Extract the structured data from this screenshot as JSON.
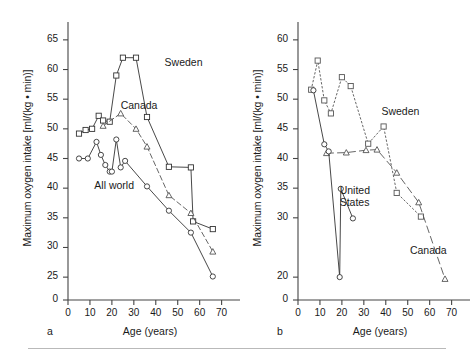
{
  "figure": {
    "bottom_rule": true,
    "axis_color": "#444444",
    "ink_color": "#333333"
  },
  "panels": [
    {
      "tag": "a",
      "xlabel": "Age (years)",
      "ylabel": "Maximum oxygen intake [ml/(kg • min)]"
    },
    {
      "tag": "b",
      "xlabel": "Age (years)",
      "ylabel": "Maximum oxygen intake [ml/(kg • min)]"
    }
  ],
  "chart_data": [
    {
      "type": "line",
      "panel": "a",
      "title": "",
      "xlabel": "Age (years)",
      "ylabel": "Maximum oxygen intake [ml/(kg • min)]",
      "xlim": [
        0,
        72
      ],
      "ylim_break": true,
      "y_axis_origin_label": "0",
      "ylim": [
        23,
        67
      ],
      "xticks": [
        0,
        10,
        20,
        30,
        40,
        50,
        60,
        70
      ],
      "yticks": [
        25,
        30,
        35,
        40,
        45,
        50,
        55,
        60,
        65
      ],
      "grid": false,
      "legend": "inline-annotations",
      "series": [
        {
          "name": "Sweden",
          "marker": "square",
          "linestyle": "solid",
          "color": "#333333",
          "label_x": 44,
          "label_y": 61,
          "points": [
            [
              5,
              49.2
            ],
            [
              8,
              49.8
            ],
            [
              11,
              50.0
            ],
            [
              14,
              52.2
            ],
            [
              16,
              51.4
            ],
            [
              19,
              51.2
            ],
            [
              22,
              59.0
            ],
            [
              25,
              62.0
            ],
            [
              31,
              62.0
            ],
            [
              36,
              52.0
            ],
            [
              46,
              43.6
            ],
            [
              56,
              43.5
            ],
            [
              57,
              34.4
            ],
            [
              66,
              33.1
            ]
          ]
        },
        {
          "name": "Canada",
          "marker": "triangle",
          "linestyle": "dashed",
          "color": "#555555",
          "label_x": 24,
          "label_y": 53.6,
          "points": [
            [
              16,
              50.5
            ],
            [
              24,
              52.6
            ],
            [
              31,
              50.0
            ],
            [
              36,
              47.0
            ],
            [
              46,
              38.8
            ],
            [
              56,
              35.8
            ],
            [
              66,
              29.3
            ]
          ]
        },
        {
          "name": "All world",
          "marker": "circle",
          "linestyle": "solid",
          "color": "#333333",
          "label_x": 12,
          "label_y": 40.2,
          "points": [
            [
              5,
              45.0
            ],
            [
              9,
              45.0
            ],
            [
              13,
              47.8
            ],
            [
              15,
              45.6
            ],
            [
              17,
              43.9
            ],
            [
              19,
              42.8
            ],
            [
              20,
              42.8
            ],
            [
              22,
              48.2
            ],
            [
              24,
              43.5
            ],
            [
              26,
              44.6
            ],
            [
              36,
              40.3
            ],
            [
              46,
              36.2
            ],
            [
              56,
              32.5
            ],
            [
              66,
              25.1
            ]
          ]
        }
      ]
    },
    {
      "type": "line",
      "panel": "b",
      "title": "",
      "xlabel": "Age (years)",
      "ylabel": "Maximum oxygen intake [ml/(kg • min)]",
      "xlim": [
        0,
        72
      ],
      "ylim_break": true,
      "y_axis_origin_label": "0",
      "ylim": [
        18,
        62
      ],
      "xticks": [
        0,
        10,
        20,
        30,
        40,
        50,
        60,
        70
      ],
      "yticks": [
        20,
        30,
        35,
        40,
        45,
        50,
        55,
        60
      ],
      "grid": false,
      "legend": "inline-annotations",
      "series": [
        {
          "name": "Sweden",
          "marker": "square",
          "linestyle": "dotted",
          "color": "#555555",
          "label_x": 38,
          "label_y": 47.6,
          "points": [
            [
              6,
              51.6
            ],
            [
              9,
              56.5
            ],
            [
              12,
              49.8
            ],
            [
              15,
              47.6
            ],
            [
              20,
              53.7
            ],
            [
              24,
              52.2
            ],
            [
              32,
              42.5
            ],
            [
              39,
              45.4
            ],
            [
              45,
              34.2
            ],
            [
              56,
              30.2
            ]
          ]
        },
        {
          "name": "Canada",
          "marker": "triangle",
          "linestyle": "longdash",
          "color": "#555555",
          "label_x": 51,
          "label_y": 24.2,
          "points": [
            [
              13,
              40.9
            ],
            [
              22,
              41.0
            ],
            [
              31,
              41.4
            ],
            [
              36,
              41.5
            ],
            [
              45,
              37.6
            ],
            [
              55,
              32.6
            ],
            [
              67,
              19.7
            ]
          ]
        },
        {
          "name": "United States",
          "marker": "circle",
          "linestyle": "solid",
          "color": "#333333",
          "label_x": 19,
          "label_y": 34.3,
          "label_line2": "States",
          "points": [
            [
              7,
              51.5
            ],
            [
              12,
              42.4
            ],
            [
              14,
              41.2
            ],
            [
              19,
              20.0
            ],
            [
              19.5,
              34.9
            ],
            [
              25,
              29.9
            ]
          ]
        }
      ]
    }
  ]
}
